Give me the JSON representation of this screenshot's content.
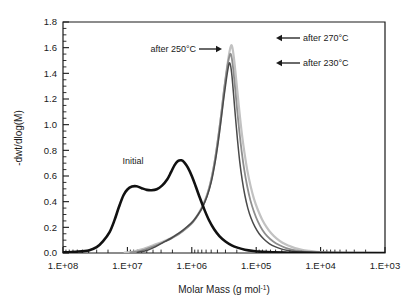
{
  "chart_data": {
    "type": "line",
    "title": "",
    "xlabel": "Molar Mass (g mol-1)",
    "xlabel_base": "Molar Mass (g mol",
    "xlabel_sup": "-1",
    "xlabel_tail": ")",
    "ylabel": "-dwt/dlog(M)",
    "x_scale": "log",
    "x_direction": "reversed",
    "xlim": [
      1000,
      100000000
    ],
    "ylim": [
      0.0,
      1.8
    ],
    "grid": false,
    "legend": "none",
    "x_ticklabels": [
      "1.E+08",
      "1.E+07",
      "1.E+06",
      "1.E+05",
      "1.E+04",
      "1.E+03"
    ],
    "x_tickvalues": [
      100000000,
      10000000,
      1000000,
      100000,
      10000,
      1000
    ],
    "y_ticklabels": [
      "0.0",
      "0.2",
      "0.4",
      "0.6",
      "0.8",
      "1.0",
      "1.2",
      "1.4",
      "1.6",
      "1.8"
    ],
    "y_tickvalues": [
      0.0,
      0.2,
      0.4,
      0.6,
      0.8,
      1.0,
      1.2,
      1.4,
      1.6,
      1.8
    ],
    "y_minor_step": 0.05,
    "annotations": [
      {
        "label": "Initial",
        "x_px": 133,
        "y_px": 164,
        "arrow": "none"
      },
      {
        "label": "after 250°C",
        "x_px": 196,
        "y_px": 52,
        "arrow": "right"
      },
      {
        "label": "after 270°C",
        "x_px": 303,
        "y_px": 41,
        "arrow": "left"
      },
      {
        "label": "after 230°C",
        "x_px": 303,
        "y_px": 66,
        "arrow": "left"
      }
    ],
    "series": [
      {
        "name": "Initial",
        "color": "#111111",
        "width": 2.6,
        "peak_value": 0.72,
        "peak_x": 1700000,
        "shoulder_value": 0.52,
        "shoulder_x": 12000000,
        "points": [
          [
            100000000,
            0.005
          ],
          [
            63000000,
            0.01
          ],
          [
            40000000,
            0.02
          ],
          [
            30000000,
            0.045
          ],
          [
            24000000,
            0.09
          ],
          [
            19000000,
            0.16
          ],
          [
            16000000,
            0.25
          ],
          [
            13500000,
            0.36
          ],
          [
            11500000,
            0.45
          ],
          [
            10000000,
            0.495
          ],
          [
            8500000,
            0.518
          ],
          [
            7200000,
            0.52
          ],
          [
            6000000,
            0.505
          ],
          [
            5000000,
            0.492
          ],
          [
            4200000,
            0.489
          ],
          [
            3500000,
            0.497
          ],
          [
            2900000,
            0.525
          ],
          [
            2400000,
            0.575
          ],
          [
            2100000,
            0.63
          ],
          [
            1850000,
            0.685
          ],
          [
            1650000,
            0.716
          ],
          [
            1450000,
            0.722
          ],
          [
            1300000,
            0.705
          ],
          [
            1150000,
            0.665
          ],
          [
            1000000,
            0.6
          ],
          [
            870000,
            0.52
          ],
          [
            750000,
            0.43
          ],
          [
            640000,
            0.34
          ],
          [
            540000,
            0.255
          ],
          [
            450000,
            0.185
          ],
          [
            370000,
            0.13
          ],
          [
            300000,
            0.09
          ],
          [
            240000,
            0.06
          ],
          [
            190000,
            0.04
          ],
          [
            150000,
            0.026
          ],
          [
            110000,
            0.016
          ],
          [
            80000,
            0.01
          ],
          [
            55000,
            0.006
          ],
          [
            35000,
            0.003
          ],
          [
            20000,
            0.001
          ],
          [
            1000,
            0.0
          ]
        ]
      },
      {
        "name": "after 230°C",
        "color": "#4a4a4a",
        "width": 1.5,
        "peak_value": 1.48,
        "peak_x": 260000,
        "points": [
          [
            7000000,
            0.005
          ],
          [
            5000000,
            0.02
          ],
          [
            4000000,
            0.04
          ],
          [
            3200000,
            0.065
          ],
          [
            2600000,
            0.09
          ],
          [
            2100000,
            0.115
          ],
          [
            1700000,
            0.145
          ],
          [
            1400000,
            0.175
          ],
          [
            1150000,
            0.21
          ],
          [
            950000,
            0.25
          ],
          [
            800000,
            0.3
          ],
          [
            680000,
            0.36
          ],
          [
            580000,
            0.44
          ],
          [
            500000,
            0.55
          ],
          [
            440000,
            0.69
          ],
          [
            390000,
            0.86
          ],
          [
            350000,
            1.04
          ],
          [
            320000,
            1.2
          ],
          [
            295000,
            1.33
          ],
          [
            275000,
            1.43
          ],
          [
            262000,
            1.48
          ],
          [
            250000,
            1.46
          ],
          [
            238000,
            1.38
          ],
          [
            225000,
            1.24
          ],
          [
            210000,
            1.06
          ],
          [
            195000,
            0.88
          ],
          [
            180000,
            0.71
          ],
          [
            165000,
            0.57
          ],
          [
            150000,
            0.45
          ],
          [
            135000,
            0.35
          ],
          [
            120000,
            0.27
          ],
          [
            105000,
            0.205
          ],
          [
            90000,
            0.15
          ],
          [
            75000,
            0.105
          ],
          [
            62000,
            0.072
          ],
          [
            50000,
            0.048
          ],
          [
            40000,
            0.03
          ],
          [
            31000,
            0.018
          ],
          [
            24000,
            0.01
          ],
          [
            18000,
            0.005
          ],
          [
            13000,
            0.002
          ],
          [
            9000,
            0.001
          ],
          [
            1000,
            0.0
          ]
        ]
      },
      {
        "name": "after 250°C",
        "color": "#8e8e8e",
        "width": 1.8,
        "peak_value": 1.55,
        "peak_x": 250000,
        "points": [
          [
            9000000,
            0.004
          ],
          [
            6500000,
            0.015
          ],
          [
            5000000,
            0.032
          ],
          [
            4000000,
            0.05
          ],
          [
            3200000,
            0.07
          ],
          [
            2600000,
            0.09
          ],
          [
            2100000,
            0.112
          ],
          [
            1700000,
            0.138
          ],
          [
            1400000,
            0.168
          ],
          [
            1150000,
            0.202
          ],
          [
            950000,
            0.243
          ],
          [
            800000,
            0.295
          ],
          [
            680000,
            0.36
          ],
          [
            580000,
            0.45
          ],
          [
            500000,
            0.57
          ],
          [
            440000,
            0.72
          ],
          [
            390000,
            0.9
          ],
          [
            350000,
            1.08
          ],
          [
            320000,
            1.25
          ],
          [
            295000,
            1.38
          ],
          [
            275000,
            1.48
          ],
          [
            258000,
            1.54
          ],
          [
            248000,
            1.55
          ],
          [
            238000,
            1.51
          ],
          [
            226000,
            1.42
          ],
          [
            213000,
            1.29
          ],
          [
            198000,
            1.12
          ],
          [
            183000,
            0.95
          ],
          [
            168000,
            0.79
          ],
          [
            153000,
            0.645
          ],
          [
            138000,
            0.52
          ],
          [
            123000,
            0.41
          ],
          [
            108000,
            0.32
          ],
          [
            94000,
            0.245
          ],
          [
            80000,
            0.18
          ],
          [
            67000,
            0.13
          ],
          [
            55000,
            0.092
          ],
          [
            44000,
            0.062
          ],
          [
            35000,
            0.04
          ],
          [
            27000,
            0.025
          ],
          [
            20000,
            0.014
          ],
          [
            15000,
            0.008
          ],
          [
            11000,
            0.004
          ],
          [
            7500,
            0.002
          ],
          [
            1000,
            0.0
          ]
        ]
      },
      {
        "name": "after 270°C",
        "color": "#c2c2c2",
        "width": 2.2,
        "peak_value": 1.62,
        "peak_x": 245000,
        "points": [
          [
            11000000,
            0.003
          ],
          [
            8000000,
            0.012
          ],
          [
            6000000,
            0.028
          ],
          [
            4800000,
            0.045
          ],
          [
            3900000,
            0.062
          ],
          [
            3100000,
            0.08
          ],
          [
            2500000,
            0.1
          ],
          [
            2000000,
            0.122
          ],
          [
            1650000,
            0.148
          ],
          [
            1350000,
            0.178
          ],
          [
            1100000,
            0.215
          ],
          [
            920000,
            0.258
          ],
          [
            780000,
            0.312
          ],
          [
            660000,
            0.382
          ],
          [
            560000,
            0.475
          ],
          [
            485000,
            0.6
          ],
          [
            425000,
            0.755
          ],
          [
            378000,
            0.935
          ],
          [
            340000,
            1.12
          ],
          [
            310000,
            1.29
          ],
          [
            286000,
            1.43
          ],
          [
            266000,
            1.54
          ],
          [
            252000,
            1.6
          ],
          [
            243000,
            1.62
          ],
          [
            234000,
            1.6
          ],
          [
            223000,
            1.53
          ],
          [
            211000,
            1.42
          ],
          [
            197000,
            1.27
          ],
          [
            182000,
            1.1
          ],
          [
            167000,
            0.93
          ],
          [
            152000,
            0.78
          ],
          [
            137000,
            0.64
          ],
          [
            122000,
            0.52
          ],
          [
            108000,
            0.42
          ],
          [
            94000,
            0.335
          ],
          [
            81000,
            0.262
          ],
          [
            69000,
            0.202
          ],
          [
            58000,
            0.152
          ],
          [
            48000,
            0.112
          ],
          [
            39000,
            0.08
          ],
          [
            31000,
            0.056
          ],
          [
            25000,
            0.038
          ],
          [
            19500,
            0.025
          ],
          [
            15000,
            0.016
          ],
          [
            11500,
            0.009
          ],
          [
            8500,
            0.005
          ],
          [
            6000,
            0.002
          ],
          [
            1000,
            0.0
          ]
        ]
      }
    ]
  },
  "axes_geometry": {
    "left_px": 63,
    "right_px": 385,
    "top_px": 22,
    "bottom_px": 253
  }
}
